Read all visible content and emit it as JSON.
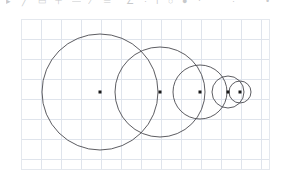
{
  "app": {
    "title": "Geometry Canvas",
    "background_color": "#ffffff"
  },
  "toolbar": {
    "visible": true,
    "clipped": true,
    "note": "toolbar row is cut off at the top edge of the screenshot; only the bottom sliver of the icon glyphs is visible",
    "icon_color": "#6f7378",
    "items": [
      {
        "name": "select-tool",
        "glyph": "▸",
        "x": 6
      },
      {
        "name": "line-tool",
        "glyph": "╱",
        "x": 22
      },
      {
        "name": "rectangle-tool",
        "glyph": "▭",
        "x": 38
      },
      {
        "name": "plus-tool",
        "glyph": "＋",
        "x": 54
      },
      {
        "name": "minus-tool",
        "glyph": "—",
        "x": 72
      },
      {
        "name": "divide-tool",
        "glyph": "∕",
        "x": 90
      },
      {
        "name": "equals-tool",
        "glyph": "═",
        "x": 104
      },
      {
        "name": "angle-tool",
        "glyph": "∠",
        "x": 126
      },
      {
        "name": "dot-tool",
        "glyph": "·",
        "x": 144
      },
      {
        "name": "text-tool",
        "glyph": "ı",
        "x": 156
      },
      {
        "name": "circle-tool",
        "glyph": "○",
        "x": 168
      },
      {
        "name": "bold-tool",
        "glyph": "●",
        "x": 182
      },
      {
        "name": "grid-tool",
        "glyph": "⋅",
        "x": 198
      },
      {
        "name": "zoom-tool",
        "glyph": "·",
        "x": 232
      },
      {
        "name": "more-tool",
        "glyph": "•",
        "x": 266
      }
    ]
  },
  "canvas": {
    "name": "drawing-canvas",
    "x": 21,
    "y": 19,
    "width": 249,
    "height": 151,
    "background_color": "#ffffff",
    "grid": {
      "visible": true,
      "spacing": 20,
      "color": "#dfe4ec",
      "border_color": "#e4e8ee"
    }
  },
  "chart_data": {
    "type": "scatter",
    "title": "",
    "xlabel": "",
    "ylabel": "",
    "grid": true,
    "legend": null,
    "xlim": [
      0,
      249
    ],
    "ylim": [
      0,
      151
    ],
    "stroke_color": "#4a4a4f",
    "center_marker_color": "#1a1a1a",
    "shapes": [
      {
        "name": "circle-1",
        "type": "circle",
        "cx": 79,
        "cy": 73,
        "r": 58
      },
      {
        "name": "circle-2",
        "type": "circle",
        "cx": 139,
        "cy": 73,
        "r": 45
      },
      {
        "name": "circle-3",
        "type": "circle",
        "cx": 179,
        "cy": 73,
        "r": 27
      },
      {
        "name": "circle-4",
        "type": "circle",
        "cx": 207,
        "cy": 73,
        "r": 16
      },
      {
        "name": "circle-5",
        "type": "circle",
        "cx": 219,
        "cy": 73,
        "r": 11
      }
    ],
    "centers_x": [
      79,
      139,
      179,
      207,
      219
    ],
    "centers_y": [
      73,
      73,
      73,
      73,
      73
    ],
    "radii": [
      58,
      45,
      27,
      16,
      11
    ]
  }
}
